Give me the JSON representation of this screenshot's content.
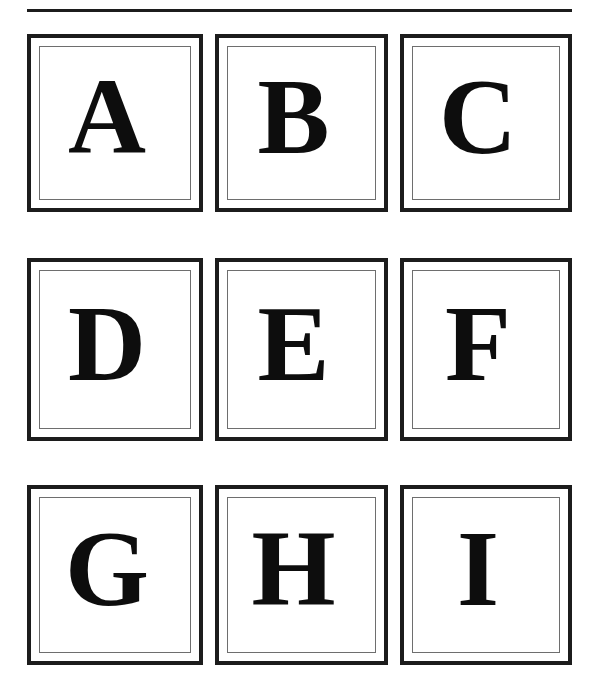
{
  "page": {
    "background_color": "#ffffff",
    "width": 595,
    "height": 691
  },
  "divider": {
    "name": "top-horizontal-rule",
    "color": "#1c1c1c"
  },
  "style": {
    "outer_border_color": "#1c1c1c",
    "inner_border_color": "#6e6e6e",
    "letter_color": "#0d0d0d"
  },
  "grid": {
    "rows": 3,
    "columns": 3,
    "cells": [
      {
        "letter": "A",
        "row": 0,
        "col": 0
      },
      {
        "letter": "B",
        "row": 0,
        "col": 1
      },
      {
        "letter": "C",
        "row": 0,
        "col": 2
      },
      {
        "letter": "D",
        "row": 1,
        "col": 0
      },
      {
        "letter": "E",
        "row": 1,
        "col": 1
      },
      {
        "letter": "F",
        "row": 1,
        "col": 2
      },
      {
        "letter": "G",
        "row": 2,
        "col": 0
      },
      {
        "letter": "H",
        "row": 2,
        "col": 1
      },
      {
        "letter": "I",
        "row": 2,
        "col": 2
      }
    ]
  }
}
